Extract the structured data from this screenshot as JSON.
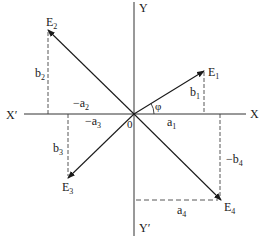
{
  "diagram": {
    "type": "vector-components-four-quadrants",
    "axes": {
      "x_pos": "X",
      "x_neg": "X′",
      "y_pos": "Y",
      "y_neg": "Y′",
      "origin": "0"
    },
    "angle_label": "φ",
    "vectors": [
      {
        "name": "E",
        "sub": "1",
        "quadrant": "I",
        "horizontal": "a",
        "horizontal_sub": "1",
        "horizontal_sign": "",
        "vertical": "b",
        "vertical_sub": "1",
        "vertical_sign": ""
      },
      {
        "name": "E",
        "sub": "2",
        "quadrant": "II",
        "horizontal": "a",
        "horizontal_sub": "2",
        "horizontal_sign": "−",
        "vertical": "b",
        "vertical_sub": "2",
        "vertical_sign": ""
      },
      {
        "name": "E",
        "sub": "3",
        "quadrant": "III",
        "horizontal": "a",
        "horizontal_sub": "3",
        "horizontal_sign": "−",
        "vertical": "b",
        "vertical_sub": "3",
        "vertical_sign": ""
      },
      {
        "name": "E",
        "sub": "4",
        "quadrant": "IV",
        "horizontal": "a",
        "horizontal_sub": "4",
        "horizontal_sign": "",
        "vertical": "b",
        "vertical_sub": "4",
        "vertical_sign": "−"
      }
    ]
  }
}
